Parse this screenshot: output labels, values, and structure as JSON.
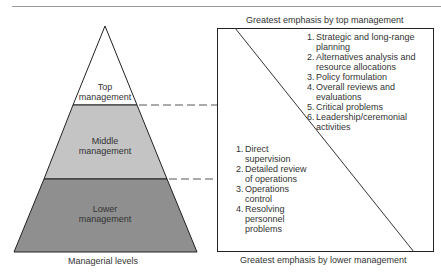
{
  "pyramid": {
    "caption": "Managerial levels",
    "levels": [
      {
        "label_line1": "Top",
        "label_line2": "management",
        "fill": "#ffffff"
      },
      {
        "label_line1": "Middle",
        "label_line2": "management",
        "fill": "#c4c4c4"
      },
      {
        "label_line1": "Lower",
        "label_line2": "management",
        "fill": "#8f8f8f"
      }
    ]
  },
  "emphasis_box": {
    "top_caption": "Greatest emphasis by top management",
    "bottom_caption": "Greatest emphasis by lower management",
    "top_list": [
      {
        "num": "1.",
        "text": "Strategic and long-range planning"
      },
      {
        "num": "2.",
        "text": "Alternatives analysis and resource allocations"
      },
      {
        "num": "3.",
        "text": "Policy formulation"
      },
      {
        "num": "4.",
        "text": "Overall reviews and evaluations"
      },
      {
        "num": "5.",
        "text": "Critical problems"
      },
      {
        "num": "6.",
        "text": "Leadership/ceremonial activities"
      }
    ],
    "bottom_list": [
      {
        "num": "1.",
        "text": "Direct supervision"
      },
      {
        "num": "2.",
        "text": "Detailed review of operations"
      },
      {
        "num": "3.",
        "text": "Operations control"
      },
      {
        "num": "4.",
        "text": "Resolving personnel problems"
      }
    ]
  }
}
